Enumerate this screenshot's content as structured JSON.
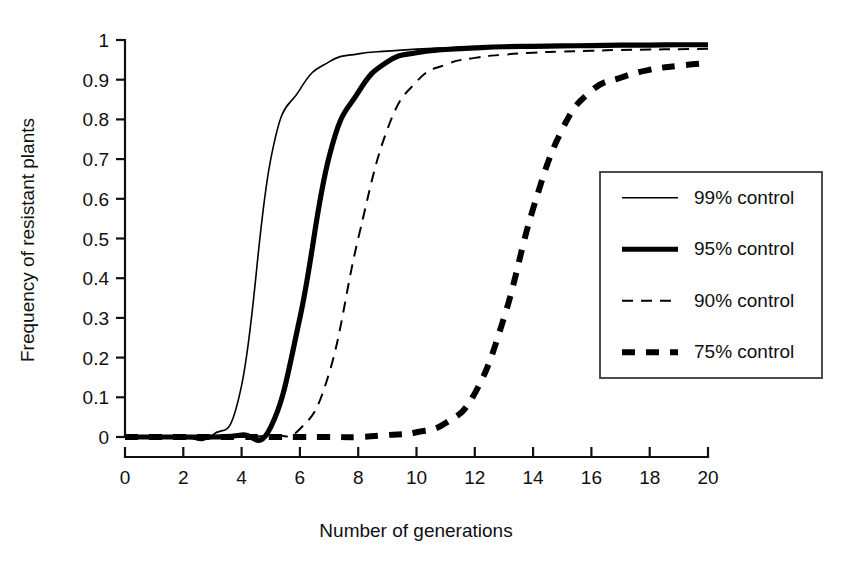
{
  "chart_data": {
    "type": "line",
    "title": "",
    "xlabel": "Number of generations",
    "ylabel": "Frequency of resistant plants",
    "xlim": [
      0,
      20
    ],
    "ylim": [
      0,
      1
    ],
    "grid": false,
    "legend_position": "right",
    "xticks": [
      "0",
      "2",
      "4",
      "6",
      "8",
      "10",
      "12",
      "14",
      "16",
      "18",
      "20"
    ],
    "xtick_values": [
      0,
      2,
      4,
      6,
      8,
      10,
      12,
      14,
      16,
      18,
      20
    ],
    "yticks": [
      "0",
      "0.1",
      "0.2",
      "0.3",
      "0.4",
      "0.5",
      "0.6",
      "0.7",
      "0.8",
      "0.9",
      "1"
    ],
    "ytick_values": [
      0,
      0.1,
      0.2,
      0.3,
      0.4,
      0.5,
      0.6,
      0.7,
      0.8,
      0.9,
      1
    ],
    "x": [
      0,
      1,
      2,
      3,
      4,
      5,
      6,
      7,
      8,
      9,
      10,
      11,
      12,
      13,
      14,
      15,
      16,
      17,
      18,
      19,
      20
    ],
    "series": [
      {
        "name": "99% control",
        "style": "solid-thin",
        "stroke_width": 1.6,
        "dash": "none",
        "values": [
          0.0,
          0.0,
          0.0,
          0.005,
          0.13,
          0.7,
          0.875,
          0.945,
          0.965,
          0.972,
          0.977,
          0.98,
          0.982,
          0.983,
          0.984,
          0.985,
          0.986,
          0.986,
          0.987,
          0.987,
          0.988
        ]
      },
      {
        "name": "95% control",
        "style": "solid-thick",
        "stroke_width": 5.2,
        "dash": "none",
        "values": [
          0.0,
          0.0,
          0.0,
          0.0,
          0.005,
          0.025,
          0.3,
          0.705,
          0.868,
          0.945,
          0.968,
          0.976,
          0.98,
          0.983,
          0.984,
          0.985,
          0.986,
          0.987,
          0.987,
          0.988,
          0.988
        ]
      },
      {
        "name": "90% control",
        "style": "dashed-thin",
        "stroke_width": 2.0,
        "dash": "11,8",
        "values": [
          0.0,
          0.0,
          0.0,
          0.0,
          0.0,
          0.005,
          0.02,
          0.16,
          0.5,
          0.775,
          0.895,
          0.938,
          0.955,
          0.963,
          0.968,
          0.971,
          0.973,
          0.975,
          0.976,
          0.977,
          0.978
        ]
      },
      {
        "name": "75% control",
        "style": "dashed-thick",
        "stroke_width": 6.0,
        "dash": "13,11",
        "values": [
          0.0,
          0.0,
          0.0,
          0.0,
          0.0,
          0.0,
          0.0,
          0.0,
          0.0,
          0.005,
          0.012,
          0.035,
          0.11,
          0.3,
          0.575,
          0.775,
          0.872,
          0.905,
          0.925,
          0.935,
          0.942
        ]
      }
    ]
  },
  "legend": {
    "items": [
      {
        "label": "99% control"
      },
      {
        "label": "95% control"
      },
      {
        "label": "90% control"
      },
      {
        "label": "75% control"
      }
    ]
  }
}
